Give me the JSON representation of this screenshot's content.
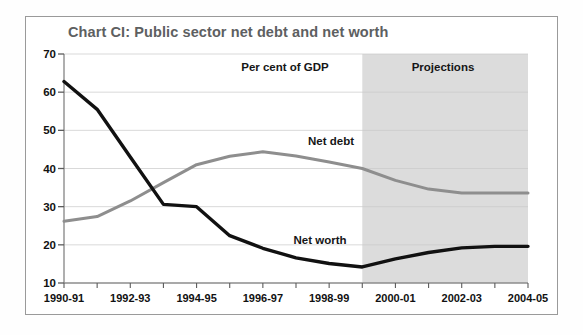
{
  "figure": {
    "title": "Chart CI: Public sector net debt and net worth",
    "title_color": "#5d6061",
    "frame_color": "#9a9a9a",
    "background": "#ffffff"
  },
  "annotations": {
    "units": "Per cent of GDP",
    "projections": "Projections",
    "net_debt_label": "Net debt",
    "net_worth_label": "Net worth"
  },
  "chart_data": {
    "type": "line",
    "title": "Chart CI: Public sector net debt and net worth",
    "subtitle": "Per cent of GDP",
    "xlabel": "",
    "ylabel": "",
    "ylim": [
      10,
      70
    ],
    "yticks": [
      10,
      20,
      30,
      40,
      50,
      60,
      70
    ],
    "ytick_labels": [
      "10",
      "20",
      "30",
      "40",
      "50",
      "60",
      "70"
    ],
    "grid": true,
    "grid_axis": "y",
    "legend": "inline-annotations",
    "categories": [
      "1990-91",
      "1991-92",
      "1992-93",
      "1993-94",
      "1994-95",
      "1995-96",
      "1996-97",
      "1997-98",
      "1998-99",
      "1999-00",
      "2000-01",
      "2001-02",
      "2002-03",
      "2003-04",
      "2004-05"
    ],
    "xtick_labels": [
      "1990-91",
      "1992-93",
      "1994-95",
      "1996-97",
      "1998-99",
      "2000-01",
      "2002-03",
      "2004-05"
    ],
    "xtick_label_indices": [
      0,
      2,
      4,
      6,
      8,
      10,
      12,
      14
    ],
    "series": [
      {
        "name": "Net debt",
        "color": "#8e8e8e",
        "values": [
          26.2,
          27.4,
          31.5,
          36.3,
          41.0,
          43.2,
          44.4,
          43.3,
          41.7,
          40.0,
          36.9,
          34.6,
          33.6,
          33.6,
          33.6
        ]
      },
      {
        "name": "Net worth",
        "color": "#111111",
        "values": [
          62.8,
          55.5,
          43.0,
          30.6,
          30.0,
          22.4,
          19.1,
          16.6,
          15.1,
          14.2,
          16.3,
          18.0,
          19.2,
          19.6,
          19.6
        ]
      }
    ],
    "projection_band": {
      "label": "Projections",
      "start_category": "1999-00",
      "end_category": "2004-05",
      "color": "#dcdcdc"
    }
  },
  "axes": {
    "y_ticks": [
      "70",
      "60",
      "50",
      "40",
      "30",
      "20",
      "10"
    ],
    "x_ticks": [
      "1990-91",
      "1992-93",
      "1994-95",
      "1996-97",
      "1998-99",
      "2000-01",
      "2002-03",
      "2004-05"
    ]
  }
}
